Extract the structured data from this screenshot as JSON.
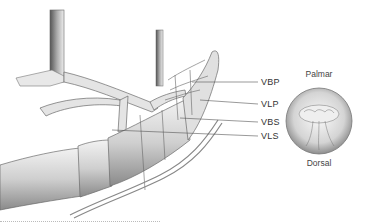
{
  "figure": {
    "type": "anatomical-illustration"
  },
  "labels": [
    {
      "id": "vbp",
      "text": "VBP"
    },
    {
      "id": "vlp",
      "text": "VLP"
    },
    {
      "id": "vbs",
      "text": "VBS"
    },
    {
      "id": "vls",
      "text": "VLS"
    }
  ],
  "cross_section": {
    "top_label": "Palmar",
    "bottom_label": "Dorsal"
  },
  "colors": {
    "line": "#555555",
    "tissue": "#d9d9d9",
    "background": "#ffffff"
  }
}
